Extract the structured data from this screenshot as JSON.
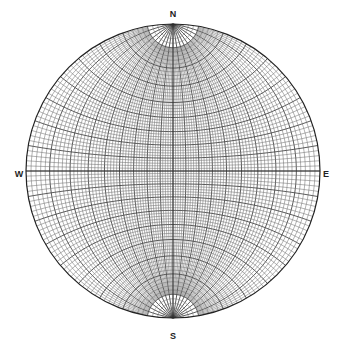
{
  "diagram": {
    "type": "wulff-stereonet",
    "center": [
      173,
      171
    ],
    "radius": 147,
    "minor_interval_deg": 2,
    "major_interval_deg": 10,
    "line_color": "#555555",
    "major_line_color": "#333333",
    "background": "#ffffff"
  },
  "labels": {
    "north": {
      "text": "N",
      "x": 173,
      "y": 14
    },
    "south": {
      "text": "S",
      "x": 173,
      "y": 336
    },
    "west": {
      "text": "W",
      "x": 19,
      "y": 174
    },
    "east": {
      "text": "E",
      "x": 326,
      "y": 174
    }
  }
}
